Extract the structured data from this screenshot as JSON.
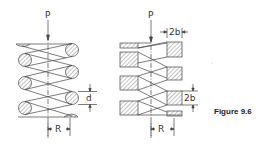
{
  "figure": {
    "caption": "Figure 9.6",
    "left_spring": {
      "type": "round-wire helical spring",
      "load_label": "P",
      "radius_label": "R",
      "wire_dimension_label": "d"
    },
    "right_spring": {
      "type": "square-wire helical spring",
      "load_label": "P",
      "radius_label": "R",
      "wire_width_label": "2b",
      "wire_height_label": "2b"
    },
    "colors": {
      "line": "#444444",
      "hatch": "#666666",
      "background": "#ffffff"
    }
  }
}
